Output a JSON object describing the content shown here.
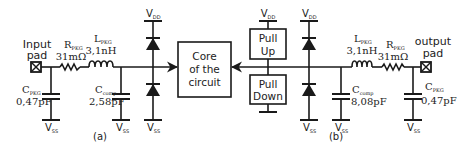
{
  "diagram": {
    "colors": {
      "stroke": "#1a1a1a",
      "text": "#222222",
      "background": "#ffffff"
    },
    "left_circuit": {
      "caption": "(a)",
      "pad_label_line1": "Input",
      "pad_label_line2": "pad",
      "r_pkg": {
        "name": "R",
        "sub": "PKG",
        "value": "31mΩ"
      },
      "l_pkg": {
        "name": "L",
        "sub": "PKG",
        "value": "3,1nH"
      },
      "c_pkg": {
        "name": "C",
        "sub": "PKG",
        "value": "0,47pF"
      },
      "c_comp": {
        "name": "C",
        "sub": "comp",
        "value": "2,58pF"
      },
      "vdd": {
        "name": "V",
        "sub": "DD"
      },
      "vss": {
        "name": "V",
        "sub": "SS"
      }
    },
    "core": {
      "line1": "Core",
      "line2": "of the",
      "line3": "circuit"
    },
    "driver": {
      "pull_up_line1": "Pull",
      "pull_up_line2": "Up",
      "pull_down_line1": "Pull",
      "pull_down_line2": "Down",
      "vdd": {
        "name": "V",
        "sub": "DD"
      }
    },
    "right_circuit": {
      "caption": "(b)",
      "pad_label_line1": "output",
      "pad_label_line2": "pad",
      "r_pkg": {
        "name": "R",
        "sub": "PKG",
        "value": "31mΩ"
      },
      "l_pkg": {
        "name": "L",
        "sub": "PKG",
        "value": "3,1nH"
      },
      "c_pkg": {
        "name": "C",
        "sub": "PKG",
        "value": "0,47pF"
      },
      "c_comp": {
        "name": "C",
        "sub": "comp",
        "value": "8,08pF"
      },
      "vdd": {
        "name": "V",
        "sub": "DD"
      },
      "vss": {
        "name": "V",
        "sub": "SS"
      }
    }
  }
}
